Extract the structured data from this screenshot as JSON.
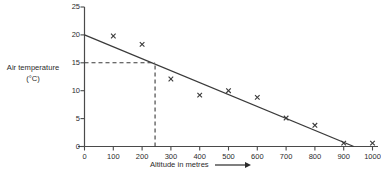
{
  "chart_data": {
    "type": "scatter",
    "title": "",
    "xlabel": "Altitude in metres",
    "ylabel": "Air temperature",
    "ylabel_unit": "(°C)",
    "xlim": [
      0,
      1050
    ],
    "ylim": [
      0,
      25
    ],
    "x_ticks": [
      0,
      100,
      200,
      300,
      400,
      500,
      600,
      700,
      800,
      900,
      1000
    ],
    "y_ticks": [
      0,
      5,
      10,
      15,
      20,
      25
    ],
    "grid": false,
    "legend": null,
    "marker": "x",
    "marker_color": "#3a3a3a",
    "axis_color": "#4a4a4a",
    "line_color": "#3a3a3a",
    "points": [
      {
        "x": 100,
        "y": 19.8
      },
      {
        "x": 200,
        "y": 18.3
      },
      {
        "x": 300,
        "y": 12.1
      },
      {
        "x": 400,
        "y": 9.2
      },
      {
        "x": 500,
        "y": 10.0
      },
      {
        "x": 600,
        "y": 8.8
      },
      {
        "x": 700,
        "y": 5.1
      },
      {
        "x": 800,
        "y": 3.8
      },
      {
        "x": 900,
        "y": 0.6
      },
      {
        "x": 1000,
        "y": 0.6
      }
    ],
    "best_fit_line": {
      "name": "line of best fit",
      "x_start": 0,
      "y_start": 20.0,
      "x_end": 935,
      "y_end": 0.0
    },
    "construction_lines": {
      "style": "dashed",
      "color": "#3a3a3a",
      "read_off_y": 15,
      "read_off_x": 245,
      "horizontal": {
        "x_from": 0,
        "x_to": 245,
        "y": 15
      },
      "vertical": {
        "x": 245,
        "y_from": 0,
        "y_to": 15
      }
    }
  },
  "axis_titles": {
    "x": "Altitude in metres",
    "y_line1": "Air temperature",
    "y_line2": "(°C)"
  },
  "x_tick_labels": [
    "0",
    "100",
    "200",
    "300",
    "400",
    "500",
    "600",
    "700",
    "800",
    "900",
    "1000"
  ],
  "y_tick_labels": [
    "0",
    "5",
    "10",
    "15",
    "20",
    "25"
  ]
}
